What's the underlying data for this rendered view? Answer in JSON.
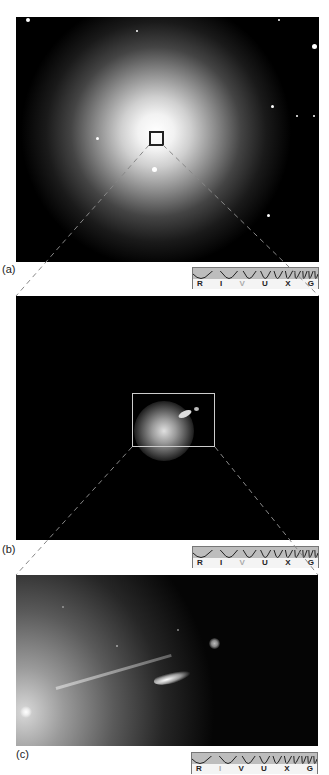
{
  "figure": {
    "panels": [
      {
        "id": "a",
        "label": "(a)",
        "description": "Giant elliptical galaxy with surrounding field stars",
        "active_band": "V"
      },
      {
        "id": "b",
        "label": "(b)",
        "description": "Zoomed galaxy core with jet, outlined box",
        "active_band": "V"
      },
      {
        "id": "c",
        "label": "(c)",
        "description": "Close-up of galactic core and relativistic jet with knots",
        "active_band": "I"
      }
    ],
    "spectrum_bands": [
      "R",
      "I",
      "V",
      "U",
      "X",
      "G"
    ],
    "colors": {
      "background": "#ffffff",
      "image": "#000000",
      "spectrum_fill": "#bdbdbd",
      "active_band": "#aaaaaa"
    }
  }
}
